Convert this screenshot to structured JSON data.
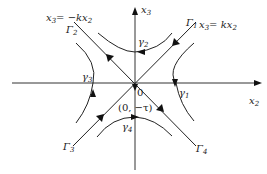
{
  "diagram": {
    "type": "phase-portrait",
    "axes": {
      "horizontal": {
        "label": "x",
        "sub": "2"
      },
      "vertical": {
        "label": "x",
        "sub": "3"
      }
    },
    "lines": [
      {
        "id": "pos",
        "equation_main": "x",
        "equation_sub": "3",
        "equation_rest": "= kx",
        "equation_sub2": "2",
        "ends": [
          "Γ1",
          "Γ3"
        ],
        "flow": "toward-origin"
      },
      {
        "id": "neg",
        "equation_main": "x",
        "equation_sub": "3",
        "equation_rest": "= −kx",
        "equation_sub2": "2",
        "ends": [
          "Γ2",
          "Γ4"
        ],
        "flow": "away-from-origin"
      }
    ],
    "branch_labels": {
      "G1": {
        "main": "Γ",
        "sub": "1"
      },
      "G2": {
        "main": "Γ",
        "sub": "2"
      },
      "G3": {
        "main": "Γ",
        "sub": "3"
      },
      "G4": {
        "main": "Γ",
        "sub": "4"
      }
    },
    "curve_labels": {
      "g1": {
        "main": "γ",
        "sub": "1"
      },
      "g2": {
        "main": "γ",
        "sub": "2"
      },
      "g3": {
        "main": "γ",
        "sub": "3"
      },
      "g4": {
        "main": "γ",
        "sub": "4"
      }
    },
    "origin_label": "0",
    "point_label": "(0, −τ)"
  }
}
